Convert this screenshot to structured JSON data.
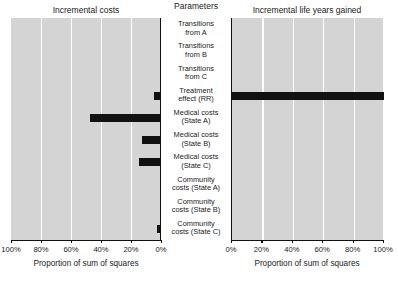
{
  "figure": {
    "left_panel_title": "Incremental costs",
    "center_column_title": "Parameters",
    "right_panel_title": "Incremental life years gained",
    "left_axis_title": "Proportion of sum of squares",
    "right_axis_title": "Proportion of sum of squares",
    "bar_color": "#111111",
    "panel_color": "#d4d4d4",
    "gridline_color": "#ffffff"
  },
  "chart_data": {
    "type": "bar",
    "title": "",
    "orientation": "horizontal",
    "layout": "tornado-two-panel",
    "categories": [
      "Transitions from A",
      "Transitions from B",
      "Transitions from C",
      "Treatment effect (RR)",
      "Medical costs (State A)",
      "Medical costs (State B)",
      "Medical costs (State C)",
      "Community costs (State A)",
      "Community costs (State B)",
      "Community costs (State C)"
    ],
    "series": [
      {
        "name": "Incremental costs",
        "panel": "left",
        "xlabel": "Proportion of sum of squares",
        "xlim": [
          100,
          0
        ],
        "xticks": [
          100,
          80,
          60,
          40,
          20,
          0
        ],
        "xticklabels": [
          "100%",
          "80%",
          "60%",
          "40%",
          "20%",
          "0%"
        ],
        "values": [
          0,
          0,
          0,
          4,
          47,
          12,
          14,
          0,
          0,
          2
        ]
      },
      {
        "name": "Incremental life years gained",
        "panel": "right",
        "xlabel": "Proportion of sum of squares",
        "xlim": [
          0,
          100
        ],
        "xticks": [
          0,
          20,
          40,
          60,
          80,
          100
        ],
        "xticklabels": [
          "0%",
          "20%",
          "40%",
          "60%",
          "80%",
          "100%"
        ],
        "values": [
          0,
          0,
          0,
          100,
          0,
          0,
          0,
          0,
          0,
          0
        ]
      }
    ],
    "grid": true,
    "gridlines_at": [
      20,
      40,
      60,
      80
    ],
    "legend": "none"
  },
  "parameter_labels": [
    {
      "line1": "Transitions",
      "line2": "from A"
    },
    {
      "line1": "Transitions",
      "line2": "from B"
    },
    {
      "line1": "Transitions",
      "line2": "from C"
    },
    {
      "line1": "Treatment",
      "line2": "effect (RR)"
    },
    {
      "line1": "Medical costs",
      "line2": "(State A)"
    },
    {
      "line1": "Medical costs",
      "line2": "(State B)"
    },
    {
      "line1": "Medical costs",
      "line2": "(State C)"
    },
    {
      "line1": "Community",
      "line2": "costs (State A)"
    },
    {
      "line1": "Community",
      "line2": "costs (State B)"
    },
    {
      "line1": "Community",
      "line2": "costs (State C)"
    }
  ],
  "left_ticklabels": [
    "100%",
    "80%",
    "60%",
    "40%",
    "20%",
    "0%"
  ],
  "right_ticklabels": [
    "0%",
    "20%",
    "40%",
    "60%",
    "80%",
    "100%"
  ]
}
